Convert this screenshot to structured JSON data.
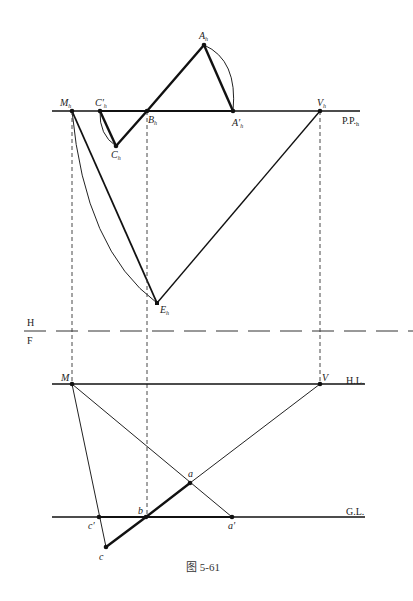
{
  "figure": {
    "caption": "图 5-61",
    "lines": {
      "picture_plane": "P.P.",
      "picture_plane_sub": "h",
      "horizon_line": "H.L.",
      "ground_line": "G.L.",
      "divider_top": "H",
      "divider_bottom": "F"
    },
    "plan_points": {
      "A_h": {
        "label": "A",
        "sub": "h",
        "x": 204,
        "y": 45
      },
      "A_h_prime": {
        "label": "A′",
        "sub": "h",
        "x": 233,
        "y": 111
      },
      "B_h": {
        "label": "B",
        "sub": "h",
        "x": 147,
        "y": 111
      },
      "C_h": {
        "label": "C",
        "sub": "h",
        "x": 116,
        "y": 146
      },
      "C_h_prime": {
        "label": "C′",
        "sub": "h",
        "x": 100,
        "y": 111
      },
      "M_h": {
        "label": "M",
        "sub": "h",
        "x": 72,
        "y": 111
      },
      "V_h": {
        "label": "V",
        "sub": "h",
        "x": 320,
        "y": 111
      },
      "E_h": {
        "label": "E",
        "sub": "h",
        "x": 157,
        "y": 303
      }
    },
    "elevation_points": {
      "M": {
        "label": "M",
        "x": 72,
        "y": 384
      },
      "V": {
        "label": "V",
        "x": 320,
        "y": 384
      },
      "a": {
        "label": "a",
        "x": 190,
        "y": 483
      },
      "a_prime": {
        "label": "a′",
        "x": 232,
        "y": 517
      },
      "b": {
        "label": "b",
        "x": 146,
        "y": 517
      },
      "c_prime": {
        "label": "c′",
        "x": 99,
        "y": 517
      },
      "c": {
        "label": "c",
        "x": 106,
        "y": 547
      }
    }
  }
}
